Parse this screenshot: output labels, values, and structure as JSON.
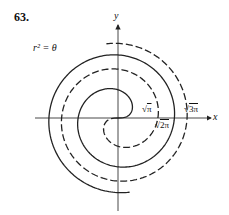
{
  "problem_number": "63.",
  "equation_label": "r² = θ",
  "axes": {
    "x_label": "x",
    "y_label": "y"
  },
  "radius_labels": [
    {
      "id": "sqrt-pi",
      "sign": "√",
      "value": "π"
    },
    {
      "id": "sqrt-2pi",
      "sign": "√",
      "value": "2π"
    },
    {
      "id": "sqrt-3pi",
      "sign": "√",
      "value": "3π"
    }
  ],
  "curve": {
    "equation": "r^2 = theta",
    "branches": [
      {
        "name": "r = +sqrt(theta)",
        "style": "solid",
        "theta_range": [
          0,
          11.15
        ]
      },
      {
        "name": "r = -sqrt(theta)",
        "style": "dashed",
        "theta_range": [
          0,
          11.15
        ]
      }
    ],
    "origin_px": [
      118,
      118
    ],
    "scale_px_per_unit": 22.5,
    "line_color": "#222222"
  }
}
